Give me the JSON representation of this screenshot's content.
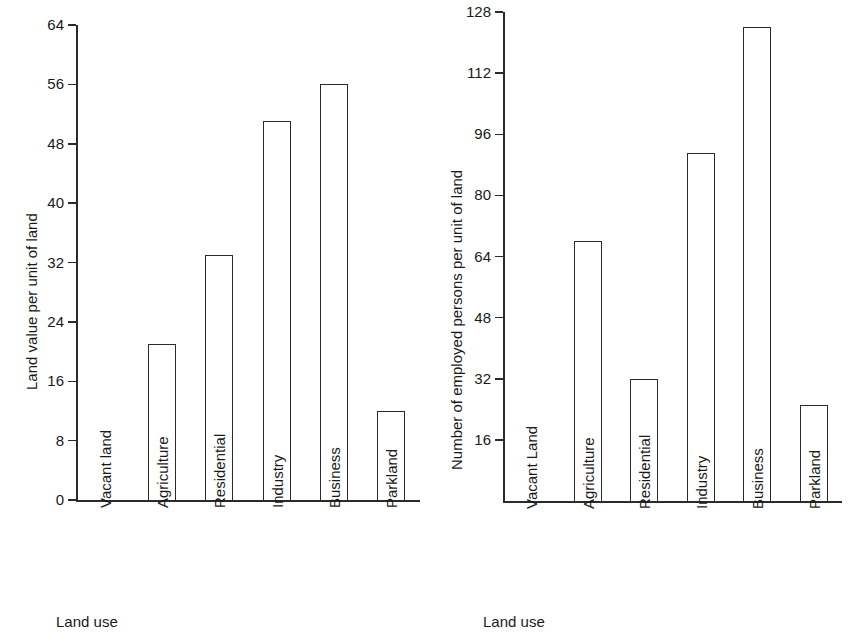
{
  "figure": {
    "background": "#ffffff",
    "ink_color": "#2b2b2b",
    "panel_count": 2
  },
  "chart_data": [
    {
      "id": "land-value-chart",
      "type": "bar",
      "title": "",
      "xlabel": "Land use",
      "ylabel": "Land value per unit of land",
      "categories": [
        "Vacant land",
        "Agriculture",
        "Residential",
        "Industry",
        "Business",
        "Parkland"
      ],
      "values": [
        0,
        21,
        33,
        51,
        56,
        12
      ],
      "yticks": [
        0,
        8,
        16,
        24,
        32,
        40,
        48,
        56,
        64
      ],
      "ytick_labels": [
        "0",
        "8",
        "16",
        "24",
        "32",
        "40",
        "48",
        "56",
        "64"
      ],
      "ylim": [
        0,
        64
      ],
      "grid": false,
      "legend": false,
      "bar_fill": "#ffffff",
      "bar_edge": "#2b2b2b"
    },
    {
      "id": "employed-persons-chart",
      "type": "bar",
      "title": "",
      "xlabel": "Land use",
      "ylabel": "Number of employed persons per unit of land",
      "categories": [
        "Vacant Land",
        "Agriculture",
        "Residential",
        "Industry",
        "Business",
        "Parkland"
      ],
      "values": [
        0,
        68,
        32,
        91,
        124,
        25
      ],
      "yticks": [
        16,
        32,
        48,
        64,
        80,
        96,
        112,
        128
      ],
      "ytick_labels": [
        "16",
        "32",
        "48",
        "64",
        "80",
        "96",
        "112",
        "128"
      ],
      "ylim": [
        0,
        128
      ],
      "grid": false,
      "legend": false,
      "bar_fill": "#ffffff",
      "bar_edge": "#2b2b2b"
    }
  ]
}
